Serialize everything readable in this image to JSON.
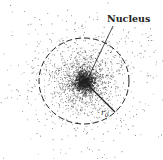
{
  "diagram": {
    "labels": {
      "nucleus": "Nucleus",
      "radius": "r",
      "radius_subscript": "0"
    },
    "geometry": {
      "center": [
        84,
        81
      ],
      "circle_rx": 45,
      "circle_ry": 43,
      "radius_end": [
        115,
        112
      ],
      "arrow_start": [
        113,
        26
      ],
      "arrow_end": [
        88,
        77
      ]
    },
    "colors": {
      "dots": "#555555",
      "line": "#222222",
      "background": "#ffffff"
    }
  }
}
